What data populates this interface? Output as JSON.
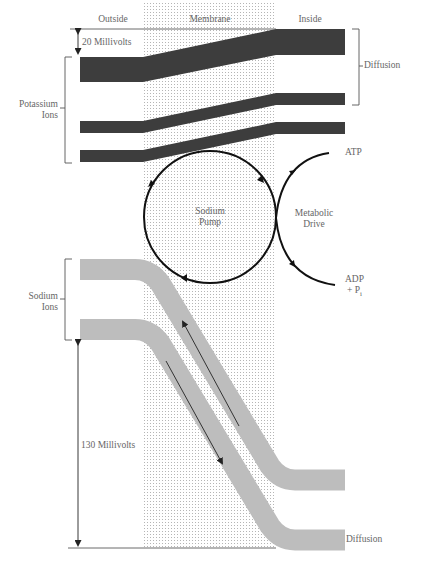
{
  "columns": {
    "outside": "Outside",
    "membrane": "Membrane",
    "inside": "Inside"
  },
  "potassium": {
    "label_line1": "Potassium",
    "label_line2": "Ions",
    "voltage": "20 Millivolts",
    "diffusion": "Diffusion",
    "color": "#3d3d3d"
  },
  "sodium": {
    "label_line1": "Sodium",
    "label_line2": "Ions",
    "voltage": "130 Millivolts",
    "diffusion": "Diffusion",
    "color": "#bdbdbd"
  },
  "pump": {
    "label_line1": "Sodium",
    "label_line2": "Pump"
  },
  "metabolic": {
    "label_line1": "Metabolic",
    "label_line2": "Drive",
    "input": "ATP",
    "output_line1": "ADP",
    "output_line2": "+ P",
    "output_sub": "i"
  },
  "colors": {
    "membrane_dots": "#b8b8b8",
    "lines": "#222222",
    "text": "#666666"
  }
}
